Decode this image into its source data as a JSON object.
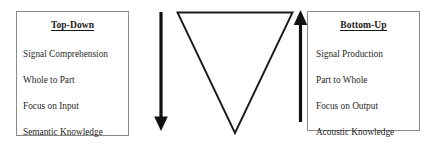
{
  "diagram": {
    "background_color": "#ffffff",
    "ink_color": "#1a1a1a",
    "box_border_color": "#8a8a8a"
  },
  "left_panel": {
    "heading": "Top-Down",
    "items": [
      "Signal Comprehension",
      "Whole to Part",
      "Focus on Input",
      "Semantic Knowledge"
    ]
  },
  "right_panel": {
    "heading": "Bottom-Up",
    "items": [
      "Signal Production",
      "Part to Whole",
      "Focus on Output",
      "Acoustic Knowledge"
    ]
  },
  "arrows": {
    "down_arrow": {
      "icon": "down-arrow-icon",
      "direction": "down",
      "color": "#111111"
    },
    "up_arrow": {
      "icon": "up-arrow-icon",
      "direction": "up",
      "color": "#111111"
    }
  },
  "triangle": {
    "icon": "inverted-triangle-icon",
    "orientation": "inverted",
    "fill": "none",
    "stroke": "#1a1a1a"
  }
}
